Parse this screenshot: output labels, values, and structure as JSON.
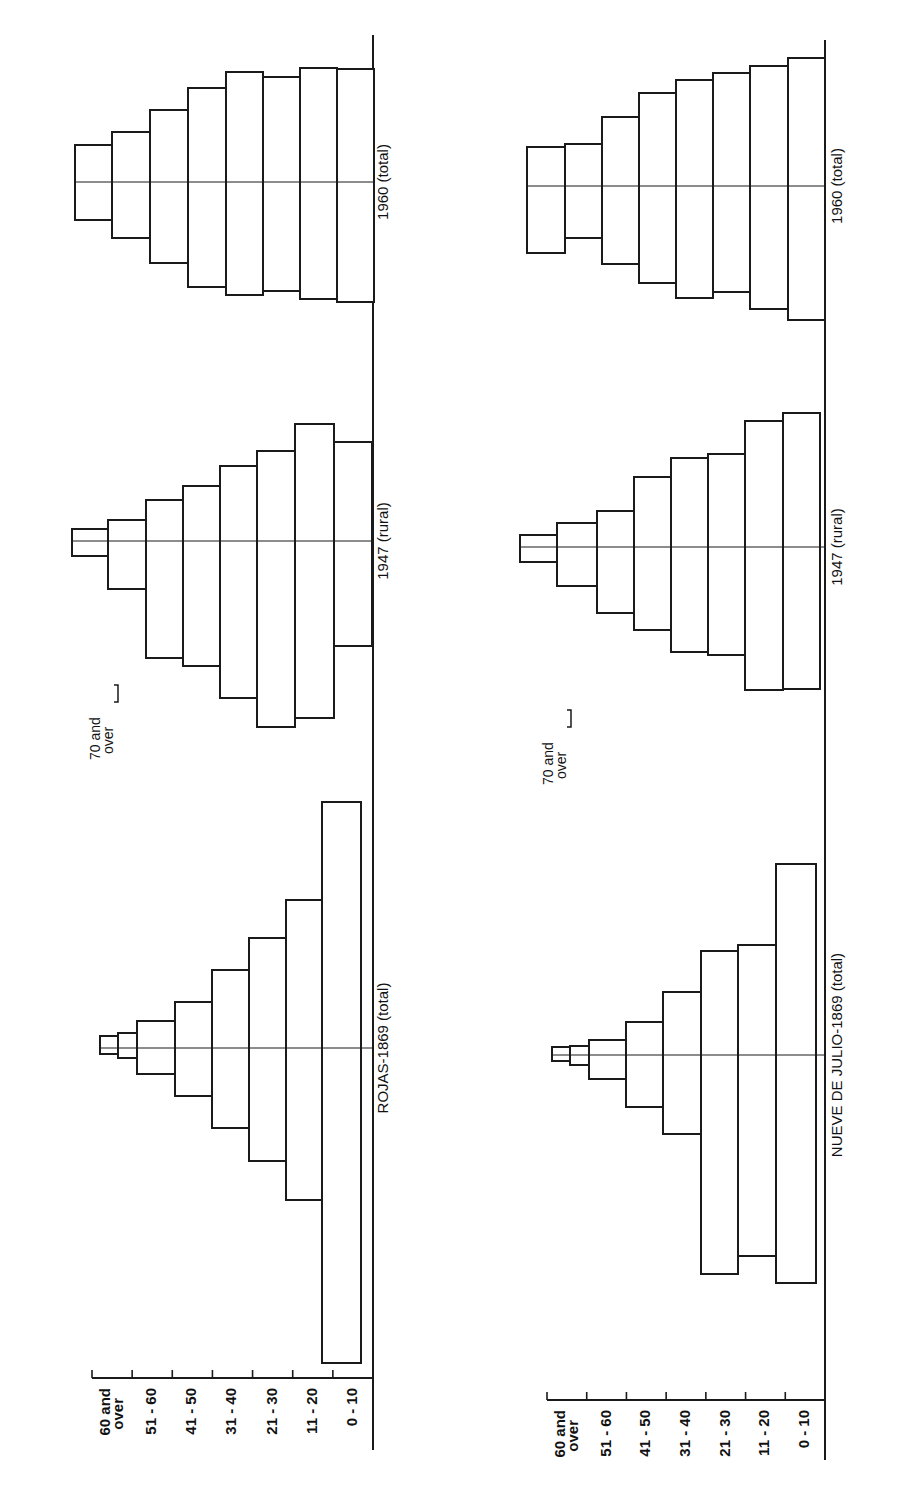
{
  "figure": {
    "orientation": "rotated-90-ccw",
    "colors": {
      "ink": "#1a1a1a",
      "paper": "#ffffff"
    }
  },
  "chart_data": {
    "type": "bar",
    "subtype": "population-pyramid",
    "title": "",
    "age_groups": [
      "0-10",
      "11-20",
      "21-30",
      "31-40",
      "41-50",
      "51-60",
      "60 and over"
    ],
    "extra_label": "70 and over",
    "panels": [
      {
        "name": "Rojas",
        "axis_labels": [
          "60 and over",
          "51-60",
          "41-50",
          "31-40",
          "21-30",
          "11-20",
          "0-10"
        ],
        "note_label": "70 and over",
        "pyramids": [
          {
            "title": "1960 (total)",
            "center_y": 182,
            "bars": [
              {
                "age": "0-10",
                "x0": 337,
                "x1": 374,
                "top": 69,
                "bottom": 302
              },
              {
                "age": "11-20",
                "x0": 300,
                "x1": 337,
                "top": 68,
                "bottom": 299
              },
              {
                "age": "21-30",
                "x0": 263,
                "x1": 300,
                "top": 77,
                "bottom": 291
              },
              {
                "age": "31-40",
                "x0": 226,
                "x1": 263,
                "top": 72,
                "bottom": 295
              },
              {
                "age": "41-50",
                "x0": 188,
                "x1": 226,
                "top": 88,
                "bottom": 287
              },
              {
                "age": "51-60",
                "x0": 150,
                "x1": 188,
                "top": 110,
                "bottom": 263
              },
              {
                "age": "61-70",
                "x0": 112,
                "x1": 150,
                "top": 132,
                "bottom": 238
              },
              {
                "age": "70 and over",
                "x0": 75,
                "x1": 112,
                "top": 145,
                "bottom": 220
              }
            ]
          },
          {
            "title": "1947 (rural)",
            "center_y": 541,
            "bars": [
              {
                "age": "0-10",
                "x0": 334,
                "x1": 372,
                "top": 442,
                "bottom": 646
              },
              {
                "age": "11-20",
                "x0": 295,
                "x1": 334,
                "top": 424,
                "bottom": 718
              },
              {
                "age": "21-30",
                "x0": 257,
                "x1": 295,
                "top": 451,
                "bottom": 727
              },
              {
                "age": "31-40",
                "x0": 220,
                "x1": 257,
                "top": 466,
                "bottom": 698
              },
              {
                "age": "41-50",
                "x0": 183,
                "x1": 220,
                "top": 486,
                "bottom": 666
              },
              {
                "age": "51-60",
                "x0": 146,
                "x1": 183,
                "top": 500,
                "bottom": 658
              },
              {
                "age": "61-70",
                "x0": 108,
                "x1": 146,
                "top": 520,
                "bottom": 589
              },
              {
                "age": "70 and over",
                "x0": 72,
                "x1": 108,
                "top": 529,
                "bottom": 556
              }
            ]
          },
          {
            "title": "ROJAS-1869 (total)",
            "center_y": 1048,
            "bars": [
              {
                "age": "0-10",
                "x0": 322,
                "x1": 361,
                "top": 802,
                "bottom": 1363
              },
              {
                "age": "11-20",
                "x0": 286,
                "x1": 322,
                "top": 900,
                "bottom": 1200
              },
              {
                "age": "21-30",
                "x0": 249,
                "x1": 286,
                "top": 938,
                "bottom": 1161
              },
              {
                "age": "31-40",
                "x0": 212,
                "x1": 249,
                "top": 970,
                "bottom": 1128
              },
              {
                "age": "41-50",
                "x0": 175,
                "x1": 212,
                "top": 1002,
                "bottom": 1096
              },
              {
                "age": "51-60",
                "x0": 137,
                "x1": 175,
                "top": 1021,
                "bottom": 1074
              },
              {
                "age": "61-70",
                "x0": 118,
                "x1": 137,
                "top": 1033,
                "bottom": 1058
              },
              {
                "age": "70 and over",
                "x0": 100,
                "x1": 118,
                "top": 1036,
                "bottom": 1054
              }
            ]
          }
        ],
        "baseline_x": 373,
        "axis": {
          "y": 1378,
          "x0": 92,
          "x1": 360
        }
      },
      {
        "name": "Nueve de Julio",
        "axis_labels": [
          "60 and over",
          "51-60",
          "41-50",
          "31-40",
          "21-30",
          "11-20",
          "0-10"
        ],
        "note_label": "70 and over",
        "pyramids": [
          {
            "title": "1960 (total)",
            "center_y": 186,
            "bars": [
              {
                "age": "0-10",
                "x0": 788,
                "x1": 825,
                "top": 58,
                "bottom": 320
              },
              {
                "age": "11-20",
                "x0": 750,
                "x1": 788,
                "top": 66,
                "bottom": 309
              },
              {
                "age": "21-30",
                "x0": 713,
                "x1": 750,
                "top": 73,
                "bottom": 292
              },
              {
                "age": "31-40",
                "x0": 676,
                "x1": 713,
                "top": 80,
                "bottom": 298
              },
              {
                "age": "41-50",
                "x0": 639,
                "x1": 676,
                "top": 93,
                "bottom": 283
              },
              {
                "age": "51-60",
                "x0": 602,
                "x1": 639,
                "top": 117,
                "bottom": 264
              },
              {
                "age": "61-70",
                "x0": 565,
                "x1": 602,
                "top": 144,
                "bottom": 238
              },
              {
                "age": "70 and over",
                "x0": 527,
                "x1": 565,
                "top": 147,
                "bottom": 253
              }
            ]
          },
          {
            "title": "1947 (rural)",
            "center_y": 547,
            "bars": [
              {
                "age": "0-10",
                "x0": 783,
                "x1": 820,
                "top": 413,
                "bottom": 689
              },
              {
                "age": "11-20",
                "x0": 745,
                "x1": 783,
                "top": 421,
                "bottom": 690
              },
              {
                "age": "21-30",
                "x0": 708,
                "x1": 745,
                "top": 454,
                "bottom": 655
              },
              {
                "age": "31-40",
                "x0": 671,
                "x1": 708,
                "top": 458,
                "bottom": 652
              },
              {
                "age": "41-50",
                "x0": 634,
                "x1": 671,
                "top": 477,
                "bottom": 630
              },
              {
                "age": "51-60",
                "x0": 597,
                "x1": 634,
                "top": 511,
                "bottom": 613
              },
              {
                "age": "61-70",
                "x0": 557,
                "x1": 597,
                "top": 523,
                "bottom": 586
              },
              {
                "age": "70 and over",
                "x0": 520,
                "x1": 557,
                "top": 535,
                "bottom": 562
              }
            ]
          },
          {
            "title": "NUEVE DE JULIO-1869 (total)",
            "center_y": 1055,
            "bars": [
              {
                "age": "0-10",
                "x0": 776,
                "x1": 816,
                "top": 864,
                "bottom": 1283
              },
              {
                "age": "11-20",
                "x0": 738,
                "x1": 776,
                "top": 945,
                "bottom": 1256
              },
              {
                "age": "21-30",
                "x0": 701,
                "x1": 738,
                "top": 951,
                "bottom": 1274
              },
              {
                "age": "31-40",
                "x0": 663,
                "x1": 701,
                "top": 992,
                "bottom": 1134
              },
              {
                "age": "41-50",
                "x0": 626,
                "x1": 663,
                "top": 1022,
                "bottom": 1107
              },
              {
                "age": "51-60",
                "x0": 589,
                "x1": 626,
                "top": 1040,
                "bottom": 1079
              },
              {
                "age": "61-70",
                "x0": 570,
                "x1": 589,
                "top": 1046,
                "bottom": 1065
              },
              {
                "age": "70 and over",
                "x0": 552,
                "x1": 570,
                "top": 1047,
                "bottom": 1061
              }
            ]
          }
        ],
        "baseline_x": 825,
        "axis": {
          "y": 1400,
          "x0": 547,
          "x1": 815
        }
      }
    ],
    "xlabel": "",
    "ylabel": "Age group"
  }
}
